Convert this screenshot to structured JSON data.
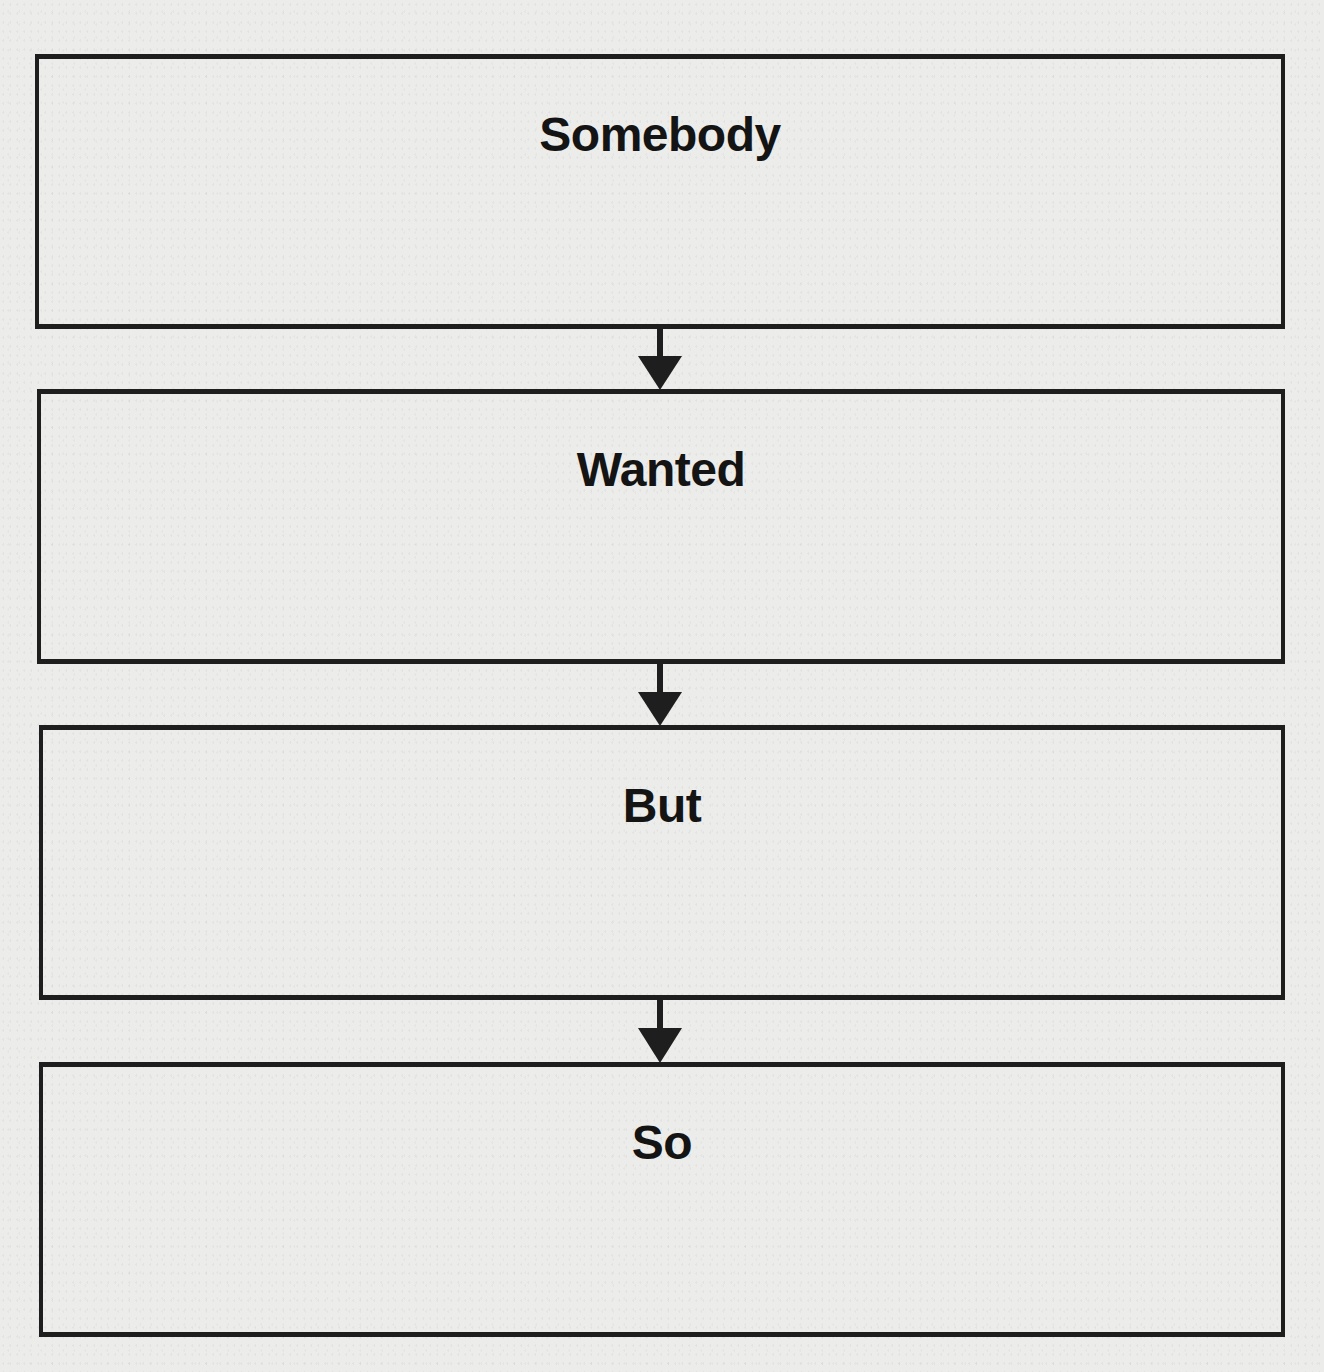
{
  "diagram": {
    "type": "flowchart",
    "direction": "top-to-bottom",
    "colors": {
      "stroke": "#1e1e1e",
      "text": "#141414",
      "paper": "#ececea"
    },
    "boxes": [
      {
        "label": "Somebody"
      },
      {
        "label": "Wanted"
      },
      {
        "label": "But"
      },
      {
        "label": "So"
      }
    ],
    "arrows": [
      {
        "from": "Somebody",
        "to": "Wanted"
      },
      {
        "from": "Wanted",
        "to": "But"
      },
      {
        "from": "But",
        "to": "So"
      }
    ]
  }
}
